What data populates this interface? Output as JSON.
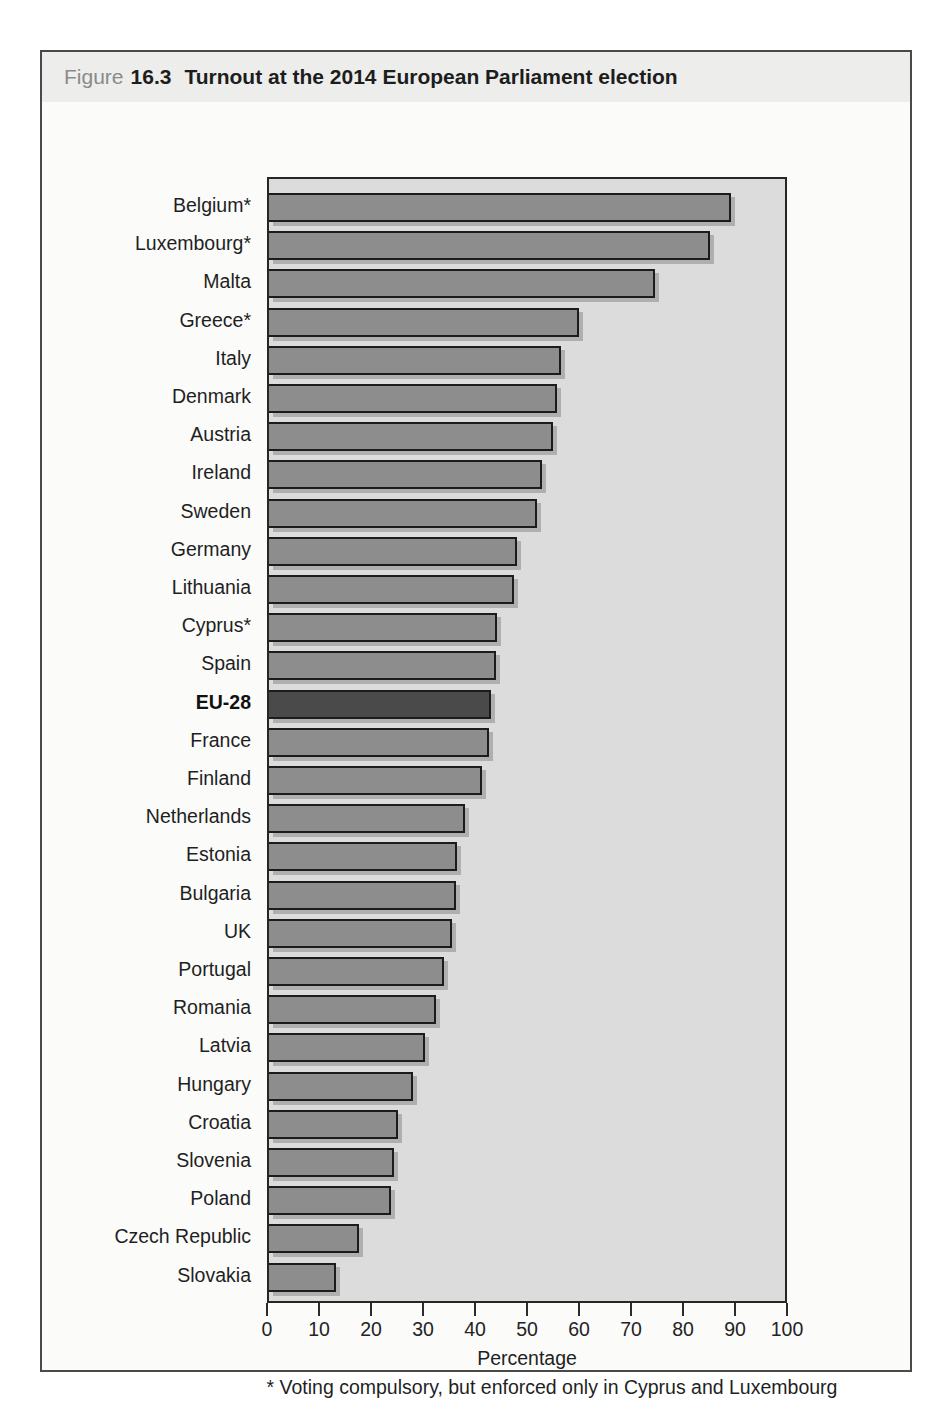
{
  "header": {
    "figure_label": "Figure",
    "figure_number": "16.3",
    "title": "Turnout at the 2014 European Parliament election"
  },
  "colors": {
    "figure_background": "#fbfbfa",
    "figure_border": "#4a4a4a",
    "header_background": "#ededec",
    "plot_background": "#dcdcdc",
    "bar_fill": "#8d8d8d",
    "bar_border": "#1c1c1c",
    "highlight_fill": "#4a4a4a"
  },
  "chart_data": {
    "type": "bar",
    "orientation": "horizontal",
    "title": "Turnout at the 2014 European Parliament election",
    "xlabel": "Percentage",
    "ylabel": "",
    "xlim": [
      0,
      100
    ],
    "x_ticks": [
      0,
      10,
      20,
      30,
      40,
      50,
      60,
      70,
      80,
      90,
      100
    ],
    "grid": false,
    "legend": false,
    "footnote": "* Voting compulsory, but enforced only in Cyprus and Luxembourg",
    "highlight_category": "EU-28",
    "categories": [
      "Belgium*",
      "Luxembourg*",
      "Malta",
      "Greece*",
      "Italy",
      "Denmark",
      "Austria",
      "Ireland",
      "Sweden",
      "Germany",
      "Lithuania",
      "Cyprus*",
      "Spain",
      "EU-28",
      "France",
      "Finland",
      "Netherlands",
      "Estonia",
      "Bulgaria",
      "UK",
      "Portugal",
      "Romania",
      "Latvia",
      "Hungary",
      "Croatia",
      "Slovenia",
      "Poland",
      "Czech Republic",
      "Slovakia"
    ],
    "values": [
      89.6,
      85.5,
      74.8,
      60.0,
      56.5,
      55.8,
      55.0,
      53.0,
      52.0,
      48.1,
      47.4,
      44.2,
      43.9,
      43.0,
      42.6,
      41.2,
      38.0,
      36.5,
      36.2,
      35.5,
      34.0,
      32.4,
      30.3,
      28.0,
      25.0,
      24.3,
      23.7,
      17.5,
      13.0
    ]
  }
}
